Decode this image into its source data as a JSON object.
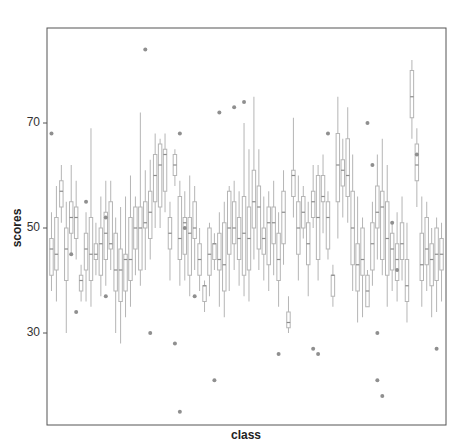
{
  "chart_data": {
    "type": "boxplot",
    "title": "",
    "xlabel": "class",
    "ylabel": "scores",
    "yticks": [
      30,
      50,
      70
    ],
    "ylim": [
      13,
      88
    ],
    "grid": false,
    "legend": null,
    "n_classes": 80,
    "box_style": {
      "stroke": "#b5b5b5",
      "fill": "#ffffff",
      "median": "#8c8c8c",
      "whisker": "#b5b5b5",
      "outlier": "#8f8f8f"
    },
    "boxes": [
      {
        "q1": 41,
        "med": 46,
        "q3": 48,
        "lo": 38,
        "hi": 53
      },
      {
        "q1": 42,
        "med": 45,
        "q3": 52,
        "lo": 36,
        "hi": 58
      },
      {
        "q1": 54,
        "med": 57,
        "q3": 59,
        "lo": 51,
        "hi": 62
      },
      {
        "q1": 40,
        "med": 46,
        "q3": 50,
        "lo": 30,
        "hi": 55
      },
      {
        "q1": 49,
        "med": 52,
        "q3": 55,
        "lo": 45,
        "hi": 62
      },
      {
        "q1": 48,
        "med": 52,
        "q3": 54,
        "lo": 44,
        "hi": 59
      },
      {
        "q1": 38,
        "med": 40,
        "q3": 41,
        "lo": 36,
        "hi": 43
      },
      {
        "q1": 42,
        "med": 46,
        "q3": 49,
        "lo": 36,
        "hi": 53
      },
      {
        "q1": 40,
        "med": 45,
        "q3": 52,
        "lo": 35,
        "hi": 69
      },
      {
        "q1": 44,
        "med": 45,
        "q3": 47,
        "lo": 41,
        "hi": 51
      },
      {
        "q1": 41,
        "med": 47,
        "q3": 50,
        "lo": 37,
        "hi": 56
      },
      {
        "q1": 44,
        "med": 49,
        "q3": 53,
        "lo": 39,
        "hi": 59
      },
      {
        "q1": 46,
        "med": 47,
        "q3": 55,
        "lo": 42,
        "hi": 59
      },
      {
        "q1": 38,
        "med": 42,
        "q3": 49,
        "lo": 30,
        "hi": 52
      },
      {
        "q1": 36,
        "med": 42,
        "q3": 46,
        "lo": 28,
        "hi": 54
      },
      {
        "q1": 38,
        "med": 44,
        "q3": 45,
        "lo": 33,
        "hi": 56
      },
      {
        "q1": 40,
        "med": 44,
        "q3": 52,
        "lo": 35,
        "hi": 60
      },
      {
        "q1": 46,
        "med": 50,
        "q3": 54,
        "lo": 41,
        "hi": 56
      },
      {
        "q1": 42,
        "med": 50,
        "q3": 54,
        "lo": 39,
        "hi": 72
      },
      {
        "q1": 50,
        "med": 51,
        "q3": 55,
        "lo": 42,
        "hi": 61
      },
      {
        "q1": 48,
        "med": 53,
        "q3": 57,
        "lo": 44,
        "hi": 63
      },
      {
        "q1": 55,
        "med": 60,
        "q3": 64,
        "lo": 50,
        "hi": 68
      },
      {
        "q1": 54,
        "med": 62,
        "q3": 66,
        "lo": 50,
        "hi": 67
      },
      {
        "q1": 57,
        "med": 64,
        "q3": 65,
        "lo": 53,
        "hi": 68
      },
      {
        "q1": 46,
        "med": 49,
        "q3": 52,
        "lo": 40,
        "hi": 55
      },
      {
        "q1": 60,
        "med": 62,
        "q3": 64,
        "lo": 58,
        "hi": 65
      },
      {
        "q1": 44,
        "med": 48,
        "q3": 56,
        "lo": 39,
        "hi": 59
      },
      {
        "q1": 45,
        "med": 51,
        "q3": 52,
        "lo": 40,
        "hi": 57
      },
      {
        "q1": 41,
        "med": 49,
        "q3": 52,
        "lo": 37,
        "hi": 60
      },
      {
        "q1": 48,
        "med": 50,
        "q3": 55,
        "lo": 42,
        "hi": 58
      },
      {
        "q1": 41,
        "med": 44,
        "q3": 47,
        "lo": 38,
        "hi": 50
      },
      {
        "q1": 36,
        "med": 39,
        "q3": 39,
        "lo": 34,
        "hi": 40
      },
      {
        "q1": 41,
        "med": 45,
        "q3": 50,
        "lo": 37,
        "hi": 51
      },
      {
        "q1": 44,
        "med": 47,
        "q3": 47,
        "lo": 42,
        "hi": 49
      },
      {
        "q1": 42,
        "med": 44,
        "q3": 49,
        "lo": 35,
        "hi": 53
      },
      {
        "q1": 38,
        "med": 43,
        "q3": 51,
        "lo": 33,
        "hi": 55
      },
      {
        "q1": 45,
        "med": 50,
        "q3": 57,
        "lo": 38,
        "hi": 58
      },
      {
        "q1": 47,
        "med": 50,
        "q3": 55,
        "lo": 42,
        "hi": 59
      },
      {
        "q1": 44,
        "med": 48,
        "q3": 52,
        "lo": 39,
        "hi": 57
      },
      {
        "q1": 41,
        "med": 49,
        "q3": 56,
        "lo": 37,
        "hi": 70
      },
      {
        "q1": 42,
        "med": 48,
        "q3": 54,
        "lo": 36,
        "hi": 65
      },
      {
        "q1": 50,
        "med": 55,
        "q3": 61,
        "lo": 44,
        "hi": 75
      },
      {
        "q1": 46,
        "med": 54,
        "q3": 58,
        "lo": 42,
        "hi": 65
      },
      {
        "q1": 45,
        "med": 48,
        "q3": 50,
        "lo": 40,
        "hi": 56
      },
      {
        "q1": 43,
        "med": 51,
        "q3": 54,
        "lo": 38,
        "hi": 57
      },
      {
        "q1": 47,
        "med": 51,
        "q3": 54,
        "lo": 41,
        "hi": 59
      },
      {
        "q1": 40,
        "med": 44,
        "q3": 49,
        "lo": 35,
        "hi": 53
      },
      {
        "q1": 47,
        "med": 53,
        "q3": 57,
        "lo": 43,
        "hi": 61
      },
      {
        "q1": 31,
        "med": 32,
        "q3": 34,
        "lo": 30,
        "hi": 37
      },
      {
        "q1": 56,
        "med": 60,
        "q3": 61,
        "lo": 52,
        "hi": 71
      },
      {
        "q1": 45,
        "med": 50,
        "q3": 55,
        "lo": 40,
        "hi": 60
      },
      {
        "q1": 50,
        "med": 53,
        "q3": 56,
        "lo": 48,
        "hi": 58
      },
      {
        "q1": 43,
        "med": 47,
        "q3": 51,
        "lo": 37,
        "hi": 55
      },
      {
        "q1": 52,
        "med": 55,
        "q3": 57,
        "lo": 50,
        "hi": 62
      },
      {
        "q1": 44,
        "med": 52,
        "q3": 60,
        "lo": 40,
        "hi": 62
      },
      {
        "q1": 55,
        "med": 56,
        "q3": 60,
        "lo": 49,
        "hi": 64
      },
      {
        "q1": 46,
        "med": 52,
        "q3": 55,
        "lo": 44,
        "hi": 57
      },
      {
        "q1": 37,
        "med": 41,
        "q3": 41,
        "lo": 35,
        "hi": 43
      },
      {
        "q1": 55,
        "med": 62,
        "q3": 68,
        "lo": 48,
        "hi": 75
      },
      {
        "q1": 58,
        "med": 61,
        "q3": 63,
        "lo": 52,
        "hi": 67
      },
      {
        "q1": 56,
        "med": 60,
        "q3": 67,
        "lo": 51,
        "hi": 73
      },
      {
        "q1": 43,
        "med": 50,
        "q3": 57,
        "lo": 38,
        "hi": 64
      },
      {
        "q1": 38,
        "med": 43,
        "q3": 47,
        "lo": 32,
        "hi": 56
      },
      {
        "q1": 41,
        "med": 44,
        "q3": 50,
        "lo": 33,
        "hi": 52
      },
      {
        "q1": 35,
        "med": 38,
        "q3": 41,
        "lo": 35,
        "hi": 42
      },
      {
        "q1": 42,
        "med": 47,
        "q3": 51,
        "lo": 39,
        "hi": 55
      },
      {
        "q1": 50,
        "med": 53,
        "q3": 58,
        "lo": 44,
        "hi": 64
      },
      {
        "q1": 44,
        "med": 54,
        "q3": 57,
        "lo": 41,
        "hi": 67
      },
      {
        "q1": 41,
        "med": 48,
        "q3": 55,
        "lo": 35,
        "hi": 62
      },
      {
        "q1": 42,
        "med": 46,
        "q3": 49,
        "lo": 38,
        "hi": 51
      },
      {
        "q1": 40,
        "med": 44,
        "q3": 47,
        "lo": 36,
        "hi": 53
      },
      {
        "q1": 44,
        "med": 47,
        "q3": 51,
        "lo": 40,
        "hi": 56
      },
      {
        "q1": 36,
        "med": 39,
        "q3": 44,
        "lo": 32,
        "hi": 51
      },
      {
        "q1": 71,
        "med": 75,
        "q3": 80,
        "lo": 67,
        "hi": 82
      },
      {
        "q1": 59,
        "med": 62,
        "q3": 66,
        "lo": 54,
        "hi": 69
      },
      {
        "q1": 40,
        "med": 43,
        "q3": 49,
        "lo": 35,
        "hi": 56
      },
      {
        "q1": 43,
        "med": 46,
        "q3": 52,
        "lo": 38,
        "hi": 55
      },
      {
        "q1": 39,
        "med": 44,
        "q3": 47,
        "lo": 33,
        "hi": 50
      },
      {
        "q1": 40,
        "med": 45,
        "q3": 50,
        "lo": 34,
        "hi": 52
      },
      {
        "q1": 42,
        "med": 45,
        "q3": 48,
        "lo": 36,
        "hi": 51
      }
    ],
    "outliers": [
      {
        "class": 0,
        "y": 68
      },
      {
        "class": 4,
        "y": 45
      },
      {
        "class": 5,
        "y": 34
      },
      {
        "class": 7,
        "y": 55
      },
      {
        "class": 11,
        "y": 52
      },
      {
        "class": 11,
        "y": 37
      },
      {
        "class": 19,
        "y": 84
      },
      {
        "class": 20,
        "y": 30
      },
      {
        "class": 25,
        "y": 28
      },
      {
        "class": 26,
        "y": 68
      },
      {
        "class": 26,
        "y": 15
      },
      {
        "class": 27,
        "y": 50
      },
      {
        "class": 29,
        "y": 37
      },
      {
        "class": 33,
        "y": 21
      },
      {
        "class": 34,
        "y": 72
      },
      {
        "class": 37,
        "y": 73
      },
      {
        "class": 39,
        "y": 74
      },
      {
        "class": 46,
        "y": 26
      },
      {
        "class": 53,
        "y": 27
      },
      {
        "class": 54,
        "y": 26
      },
      {
        "class": 56,
        "y": 68
      },
      {
        "class": 64,
        "y": 70
      },
      {
        "class": 65,
        "y": 62
      },
      {
        "class": 66,
        "y": 30
      },
      {
        "class": 66,
        "y": 21
      },
      {
        "class": 67,
        "y": 18
      },
      {
        "class": 69,
        "y": 51
      },
      {
        "class": 70,
        "y": 42
      },
      {
        "class": 74,
        "y": 64
      },
      {
        "class": 78,
        "y": 27
      }
    ]
  }
}
